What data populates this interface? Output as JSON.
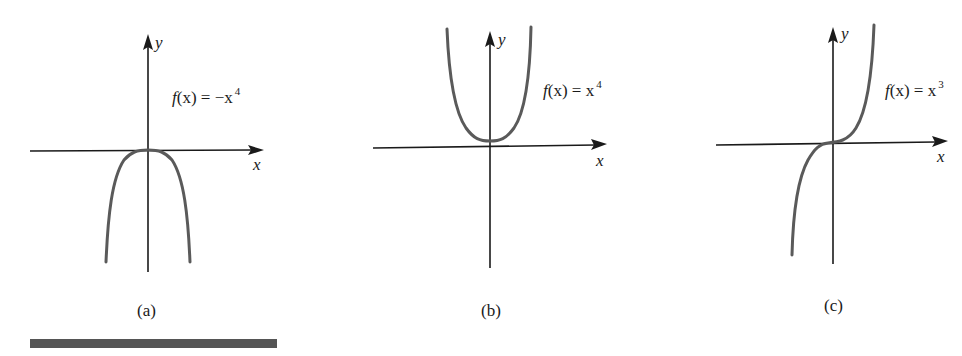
{
  "figure": {
    "panels": [
      {
        "id": "a",
        "caption": "(a)",
        "function_label": {
          "prefix": "f",
          "arg": "(x) = −x",
          "exponent": "4"
        },
        "axis_x_label": "x",
        "axis_y_label": "y",
        "function": "f(x) = -x^4",
        "shape": "downward quartic, vertex at origin"
      },
      {
        "id": "b",
        "caption": "(b)",
        "function_label": {
          "prefix": "f",
          "arg": "(x) = x",
          "exponent": "4"
        },
        "axis_x_label": "x",
        "axis_y_label": "y",
        "function": "f(x) = x^4",
        "shape": "upward quartic, vertex at origin"
      },
      {
        "id": "c",
        "caption": "(c)",
        "function_label": {
          "prefix": "f",
          "arg": "(x) = x",
          "exponent": "3"
        },
        "axis_x_label": "x",
        "axis_y_label": "y",
        "function": "f(x) = x^3",
        "shape": "cubic, inflection at origin"
      }
    ],
    "colors": {
      "axis": "#1a1a1a",
      "curve": "#5a5a5a",
      "bar": "#555555",
      "background": "#ffffff"
    }
  }
}
